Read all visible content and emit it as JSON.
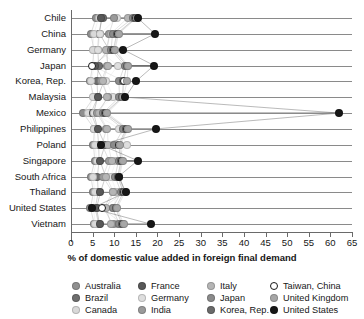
{
  "chart_data": {
    "type": "scatter",
    "title": "",
    "xlabel": "% of domestic value added in foreign final demand",
    "ylabel": "",
    "xlim": [
      0,
      65
    ],
    "xticks": [
      0,
      5,
      10,
      15,
      20,
      25,
      30,
      35,
      40,
      45,
      50,
      55,
      60,
      65
    ],
    "xtick_labels": [
      "0",
      "5",
      "10",
      "15",
      "20",
      "25",
      "30",
      "35",
      "40",
      "45",
      "50",
      "55",
      "60",
      "65"
    ],
    "grid": "horizontal",
    "legend_position": "bottom",
    "categories": [
      "Chile",
      "China",
      "Germany",
      "Japan",
      "Korea, Rep.",
      "Malaysia",
      "Mexico",
      "Philippines",
      "Poland",
      "Singapore",
      "South Africa",
      "Thailand",
      "United States",
      "Vietnam"
    ],
    "series": [
      {
        "name": "Australia",
        "color": "#8f8f8f",
        "values": [
          5.8,
          4.6,
          5.3,
          5.0,
          4.4,
          5.3,
          2.8,
          5.4,
          5.2,
          5.5,
          4.6,
          5.2,
          4.5,
          5.4
        ]
      },
      {
        "name": "Brazil",
        "color": "#6e6e6e",
        "values": [
          7.3,
          6.4,
          6.2,
          6.4,
          6.0,
          6.2,
          4.6,
          6.1,
          6.4,
          6.5,
          6.1,
          6.3,
          5.6,
          6.4
        ]
      },
      {
        "name": "Canada",
        "color": "#d9d9d9",
        "values": [
          6.4,
          5.3,
          5.0,
          5.4,
          4.6,
          5.0,
          4.0,
          5.4,
          5.6,
          5.9,
          5.1,
          5.5,
          5.2,
          5.6
        ]
      },
      {
        "name": "France",
        "color": "#585858",
        "values": [
          7.0,
          6.6,
          8.8,
          5.6,
          7.6,
          6.2,
          5.2,
          6.2,
          7.9,
          6.7,
          8.0,
          6.8,
          5.9,
          6.6
        ]
      },
      {
        "name": "Germany",
        "color": "#dedede",
        "values": [
          10.6,
          6.8,
          6.2,
          10.8,
          8.2,
          9.8,
          5.3,
          11.2,
          12.9,
          10.4,
          9.2,
          10.6,
          9.8,
          10.4
        ]
      },
      {
        "name": "India",
        "color": "#9a9a9a",
        "values": [
          10.0,
          8.8,
          8.4,
          8.4,
          7.0,
          8.6,
          6.0,
          8.2,
          7.2,
          8.8,
          7.4,
          9.6,
          7.6,
          9.6
        ]
      },
      {
        "name": "Italy",
        "color": "#b5b5b5",
        "values": [
          13.1,
          9.2,
          8.0,
          8.6,
          7.4,
          8.4,
          6.4,
          8.4,
          8.6,
          9.4,
          8.2,
          9.8,
          8.2,
          9.2
        ]
      },
      {
        "name": "Japan",
        "color": "#8b8b8b",
        "values": [
          14.4,
          9.6,
          9.3,
          12.4,
          11.1,
          11.2,
          7.4,
          12.1,
          10.0,
          11.0,
          10.2,
          11.6,
          9.6,
          11.2
        ]
      },
      {
        "name": "Korea, Rep.",
        "color": "#6a6a6a",
        "values": [
          14.9,
          10.6,
          9.8,
          12.9,
          12.1,
          11.9,
          7.8,
          12.8,
          11.0,
          11.6,
          10.8,
          12.1,
          10.3,
          11.8
        ]
      },
      {
        "name": "Taiwan, China",
        "color": "#ffffff",
        "values": [
          15.0,
          10.8,
          10.0,
          4.9,
          12.3,
          12.0,
          8.0,
          13.0,
          11.2,
          11.8,
          11.0,
          12.3,
          7.2,
          12.0
        ]
      },
      {
        "name": "United Kingdom",
        "color": "#a6a6a6",
        "values": [
          15.2,
          11.0,
          10.2,
          13.2,
          13.0,
          12.1,
          8.4,
          13.2,
          11.4,
          12.0,
          11.2,
          12.5,
          10.6,
          12.2
        ]
      },
      {
        "name": "United States",
        "color": "#171717",
        "values": [
          15.4,
          19.4,
          12.1,
          19.2,
          15.0,
          12.6,
          62.0,
          19.6,
          6.9,
          15.4,
          11.0,
          12.7,
          4.8,
          18.4
        ]
      }
    ]
  },
  "legend": {
    "columns": [
      [
        "Australia",
        "Brazil",
        "Canada"
      ],
      [
        "France",
        "Germany",
        "India"
      ],
      [
        "Italy",
        "Japan",
        "Korea, Rep."
      ],
      [
        "Taiwan, China",
        "United Kingdom",
        "United States"
      ]
    ]
  }
}
